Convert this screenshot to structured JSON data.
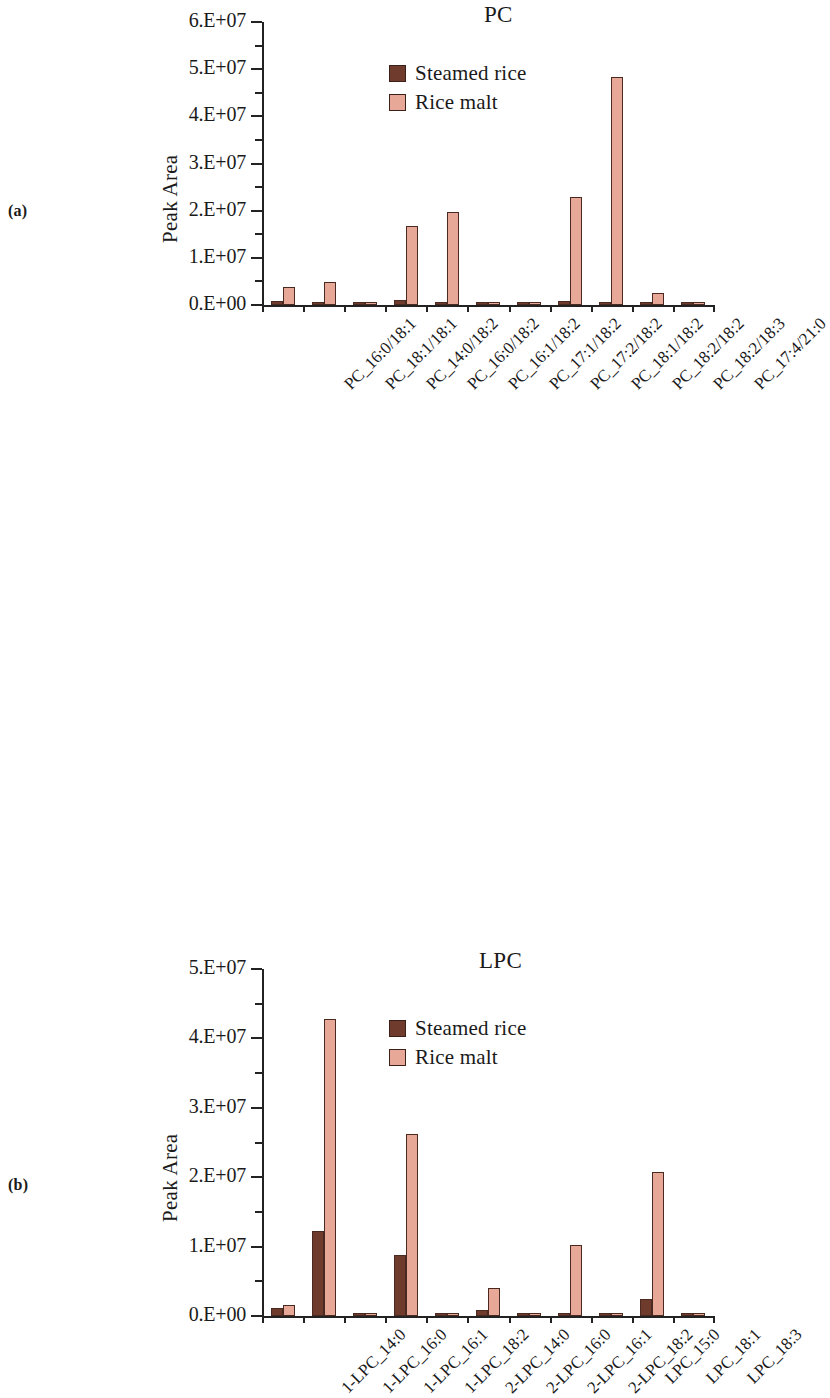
{
  "figure": {
    "panel_a_label": "(a)",
    "panel_b_label": "(b)",
    "legend_steamed": "Steamed rice",
    "legend_malt": "Rice malt",
    "color_steamed": "#6E3B2C",
    "color_malt": "#E8A897",
    "axis_color": "#222222"
  },
  "chart_data": [
    {
      "panel": "(a)",
      "type": "bar",
      "title": "PC",
      "xlabel": "",
      "ylabel": "Peak Area",
      "ylim": [
        0,
        60000000
      ],
      "ytick_labels": [
        "0.E+00",
        "1.E+07",
        "2.E+07",
        "3.E+07",
        "4.E+07",
        "5.E+07",
        "6.E+07"
      ],
      "ytick_values": [
        0,
        10000000,
        20000000,
        30000000,
        40000000,
        50000000,
        60000000
      ],
      "minor_ticks": true,
      "grid": false,
      "legend_position": "upper-center",
      "categories": [
        "PC_16:0/18:1",
        "PC_18:1/18:1",
        "PC_14:0/18:2",
        "PC_16:0/18:2",
        "PC_16:1/18:2",
        "PC_17:1/18:2",
        "PC_17:2/18:2",
        "PC_18:1/18:2",
        "PC_18:2/18:2",
        "PC_18:2/18:3",
        "PC_17:4/21:0"
      ],
      "series": [
        {
          "name": "Steamed rice",
          "color": "#6E3B2C",
          "values": [
            900000,
            600000,
            400000,
            1100000,
            300000,
            200000,
            700000,
            800000,
            400000,
            200000,
            400000
          ]
        },
        {
          "name": "Rice malt",
          "color": "#E8A897",
          "values": [
            3800000,
            4900000,
            200000,
            16800000,
            19800000,
            200000,
            200000,
            22800000,
            48400000,
            2600000,
            200000
          ]
        }
      ]
    },
    {
      "panel": "(b)",
      "type": "bar",
      "title": "LPC",
      "xlabel": "",
      "ylabel": "Peak Area",
      "ylim": [
        0,
        50000000
      ],
      "ytick_labels": [
        "0.E+00",
        "1.E+07",
        "2.E+07",
        "3.E+07",
        "4.E+07",
        "5.E+07"
      ],
      "ytick_values": [
        0,
        10000000,
        20000000,
        30000000,
        40000000,
        50000000
      ],
      "minor_ticks": true,
      "grid": false,
      "legend_position": "upper-center",
      "categories": [
        "1-LPC_14:0",
        "1-LPC_16:0",
        "1-LPC_16:1",
        "1-LPC_18:2",
        "2-LPC_14:0",
        "2-LPC_16:0",
        "2-LPC_16:1",
        "2-LPC_18:2",
        "LPC_15:0",
        "LPC_18:1",
        "LPC_18:3"
      ],
      "series": [
        {
          "name": "Steamed rice",
          "color": "#6E3B2C",
          "values": [
            1200000,
            12300000,
            300000,
            8800000,
            100000,
            900000,
            100000,
            500000,
            100000,
            2500000,
            200000
          ]
        },
        {
          "name": "Rice malt",
          "color": "#E8A897",
          "values": [
            1600000,
            42800000,
            100000,
            26200000,
            100000,
            4000000,
            100000,
            10300000,
            100000,
            20700000,
            300000
          ]
        }
      ]
    }
  ]
}
